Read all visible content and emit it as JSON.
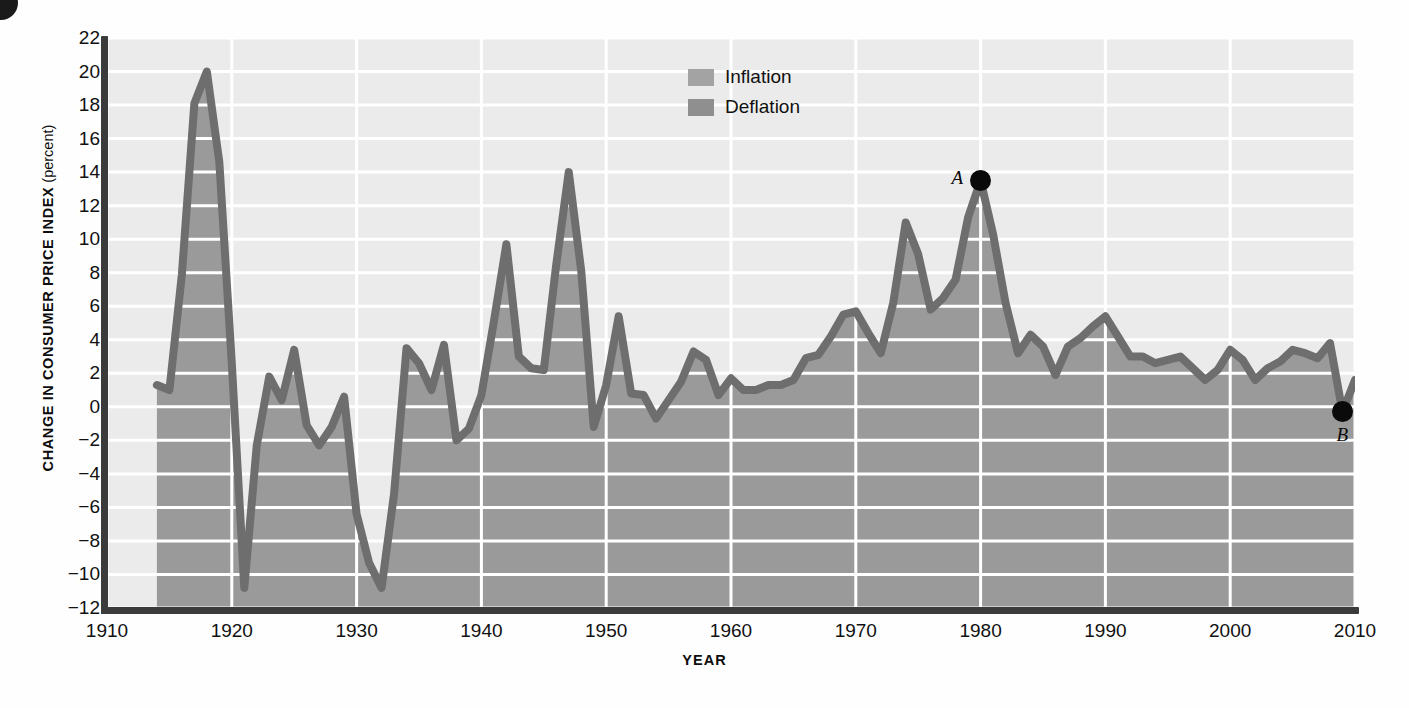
{
  "chart_data": {
    "type": "area",
    "title": "",
    "xlabel": "YEAR",
    "ylabel": "CHANGE IN CONSUMER PRICE INDEX (percent)",
    "ylabel_main": "CHANGE  IN  CONSUMER  PRICE  INDEX",
    "ylabel_unit": " (percent)",
    "xlim": [
      1910,
      2010
    ],
    "ylim": [
      -12,
      22
    ],
    "grid": true,
    "xticks": [
      1910,
      1920,
      1930,
      1940,
      1950,
      1960,
      1970,
      1980,
      1990,
      2000,
      2010
    ],
    "yticks": [
      22,
      20,
      18,
      16,
      14,
      12,
      10,
      8,
      6,
      4,
      2,
      0,
      "−2",
      "−4",
      "−6",
      "−8",
      "−10",
      "−12"
    ],
    "legend": {
      "position": "top-center-right",
      "entries": [
        {
          "label": "Inflation",
          "color": "#a3a3a3"
        },
        {
          "label": "Deflation",
          "color": "#8f8f8f"
        }
      ]
    },
    "colors": {
      "line": "#6e6e6e",
      "fill": "#9a9a9a",
      "background": "#ebebeb",
      "gridline": "#ffffff",
      "axis": "#3b3b3b",
      "annotation": "#0a0a0a"
    },
    "annotations": [
      {
        "label": "A",
        "x": 1980,
        "y": 13.5
      },
      {
        "label": "B",
        "x": 2009,
        "y": -0.3
      }
    ],
    "x": [
      1914,
      1915,
      1916,
      1917,
      1918,
      1919,
      1920,
      1921,
      1922,
      1923,
      1924,
      1925,
      1926,
      1927,
      1928,
      1929,
      1930,
      1931,
      1932,
      1933,
      1934,
      1935,
      1936,
      1937,
      1938,
      1939,
      1940,
      1941,
      1942,
      1943,
      1944,
      1945,
      1946,
      1947,
      1948,
      1949,
      1950,
      1951,
      1952,
      1953,
      1954,
      1955,
      1956,
      1957,
      1958,
      1959,
      1960,
      1961,
      1962,
      1963,
      1964,
      1965,
      1966,
      1967,
      1968,
      1969,
      1970,
      1971,
      1972,
      1973,
      1974,
      1975,
      1976,
      1977,
      1978,
      1979,
      1980,
      1981,
      1982,
      1983,
      1984,
      1985,
      1986,
      1987,
      1988,
      1989,
      1990,
      1991,
      1992,
      1993,
      1994,
      1995,
      1996,
      1997,
      1998,
      1999,
      2000,
      2001,
      2002,
      2003,
      2004,
      2005,
      2006,
      2007,
      2008,
      2009,
      2010
    ],
    "y": [
      1.3,
      1.0,
      7.9,
      18.1,
      20.0,
      14.6,
      2.6,
      -10.8,
      -2.3,
      1.8,
      0.4,
      3.4,
      -1.1,
      -2.3,
      -1.2,
      0.6,
      -6.4,
      -9.3,
      -10.8,
      -5.2,
      3.5,
      2.6,
      1.0,
      3.7,
      -2.0,
      -1.3,
      0.7,
      5.1,
      9.7,
      3.0,
      2.3,
      2.2,
      8.5,
      14.0,
      8.1,
      -1.2,
      1.3,
      5.4,
      0.8,
      0.7,
      -0.7,
      0.4,
      1.5,
      3.3,
      2.8,
      0.7,
      1.7,
      1.0,
      1.0,
      1.3,
      1.3,
      1.6,
      2.9,
      3.1,
      4.2,
      5.5,
      5.7,
      4.4,
      3.2,
      6.2,
      11.0,
      9.1,
      5.8,
      6.5,
      7.6,
      11.3,
      13.5,
      10.3,
      6.2,
      3.2,
      4.3,
      3.6,
      1.9,
      3.6,
      4.1,
      4.8,
      5.4,
      4.2,
      3.0,
      3.0,
      2.6,
      2.8,
      3.0,
      2.3,
      1.6,
      2.2,
      3.4,
      2.8,
      1.6,
      2.3,
      2.7,
      3.4,
      3.2,
      2.9,
      3.8,
      -0.3,
      1.6
    ]
  }
}
